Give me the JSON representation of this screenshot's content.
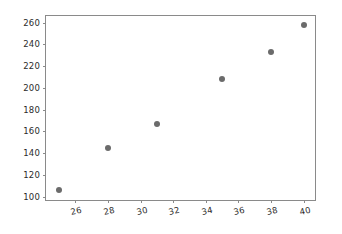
{
  "chart_data": {
    "type": "scatter",
    "title": "",
    "xlabel": "",
    "ylabel": "",
    "x": [
      25,
      28,
      31,
      35,
      38,
      40
    ],
    "y": [
      106,
      145,
      167,
      208,
      233,
      258
    ],
    "points": [
      {
        "x": 25,
        "y": 106
      },
      {
        "x": 28,
        "y": 145
      },
      {
        "x": 31,
        "y": 167
      },
      {
        "x": 35,
        "y": 208
      },
      {
        "x": 38,
        "y": 233
      },
      {
        "x": 40,
        "y": 258
      }
    ],
    "xlim": [
      24.2,
      40.7
    ],
    "ylim": [
      97,
      266
    ],
    "xticks": [
      26,
      28,
      30,
      32,
      34,
      36,
      38,
      40
    ],
    "yticks": [
      100,
      120,
      140,
      160,
      180,
      200,
      220,
      240,
      260
    ],
    "xtick_labels": [
      "26",
      "28",
      "30",
      "32",
      "34",
      "36",
      "38",
      "40"
    ],
    "ytick_labels": [
      "100",
      "120",
      "140",
      "160",
      "180",
      "200",
      "220",
      "240",
      "260"
    ],
    "grid": false,
    "legend": null,
    "marker_color": "#6b6b6b",
    "marker_size": 6,
    "axes_color": "#8a8a8a",
    "background": "#ffffff"
  }
}
